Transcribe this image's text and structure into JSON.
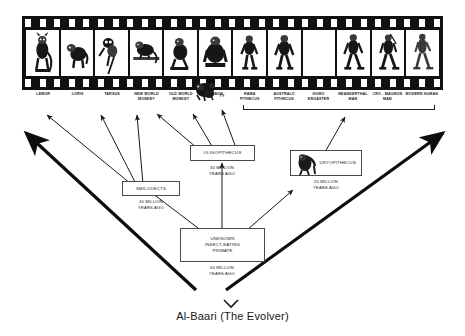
{
  "title": "Al-Baari (The Evolver)",
  "filmstrip": {
    "name": "primate-evolution-filmstrip",
    "frame_count": 12,
    "frames": [
      {
        "label": "LEMUR",
        "icon": "lemur-figure",
        "empty": false
      },
      {
        "label": "LORIS",
        "icon": "loris-figure",
        "empty": false
      },
      {
        "label": "TARSUS",
        "icon": "tarsier-figure",
        "empty": false
      },
      {
        "label": "NEW WORLD\nMONKEY",
        "icon": "new-world-monkey-figure",
        "empty": false
      },
      {
        "label": "OLD WORLD\nMONKEY",
        "icon": "old-world-monkey-figure",
        "empty": false
      },
      {
        "label": "GIBBON",
        "icon": "gorilla-figure",
        "empty": false
      },
      {
        "label": "RAMA\nPITHECUS",
        "icon": "ramapithecus-figure",
        "empty": false
      },
      {
        "label": "AUSTRALO\nPITHECUS",
        "icon": "australopithecus-figure",
        "empty": false
      },
      {
        "label": "HOMO\nERGASTER",
        "icon": "blank-frame",
        "empty": true
      },
      {
        "label": "NEANDERTHAL\nMAN",
        "icon": "neanderthal-figure",
        "empty": false
      },
      {
        "label": "CRO - MAGNON\nMAN",
        "icon": "cro-magnon-figure",
        "empty": false
      },
      {
        "label": "MODERN HUMAN",
        "icon": "modern-human-figure",
        "empty": false
      }
    ],
    "overlay_label": "TY",
    "overlay_icon": "chimpanzee-overlay-figure"
  },
  "nodes": [
    {
      "id": "oligopithecus",
      "label": "OLIGOPITHECUS",
      "age": "30 MILLION\nYEARS AGO",
      "has_icon": false
    },
    {
      "id": "smilodects",
      "label": "SMILODECTS",
      "age": "45 MILLION\nYEARS AGO",
      "has_icon": false
    },
    {
      "id": "dryopithecus",
      "label": "DRYOPITHECUS",
      "age": "20 MILLION\nYEARS AGO",
      "has_icon": true,
      "icon": "dryopithecus-ape-figure"
    },
    {
      "id": "unknown_primate",
      "label": "UNKNOWN\nINSECT-EATING\nPRIMATE",
      "age": "60 MILLION\nYEARS AGO",
      "has_icon": false
    }
  ],
  "colors": {
    "film_black": "#111111",
    "frame_white": "#ffffff",
    "line": "#222222",
    "box_border": "#4a4a4a",
    "text": "#1a1a1a",
    "background": "#ffffff"
  }
}
